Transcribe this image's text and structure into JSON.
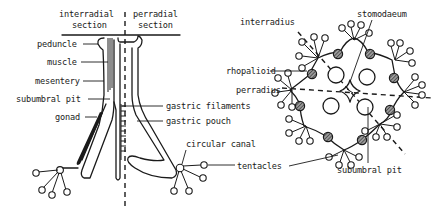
{
  "figure": {
    "left_panel": {
      "name": "longitudinal-section",
      "headers": {
        "interradial": [
          "interradial",
          "section"
        ],
        "perradial": [
          "perradial",
          "section"
        ]
      },
      "labels_left": {
        "peduncle": "peduncle",
        "muscle": "muscle",
        "mesentery": "mesentery",
        "subumbral_pit": "subumbral pit",
        "gonad": "gonad"
      },
      "labels_right": {
        "gastric_filaments": "gastric filaments",
        "gastric_pouch": "gastric pouch",
        "circular_canal": "circular canal",
        "tentacles": "tentacles"
      }
    },
    "right_panel": {
      "name": "oral-view",
      "labels": {
        "interradius": "interradius",
        "stomodaeum": "stomodaeum",
        "rhopalioid": "rhopalioid",
        "perradius": "perradius",
        "subumbral_pit": "subumbral pit"
      }
    },
    "colors": {
      "ink": "#1a1a1a",
      "background": "#ffffff"
    }
  }
}
